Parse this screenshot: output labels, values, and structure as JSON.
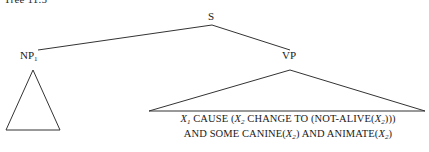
{
  "figure": {
    "type": "syntax-tree",
    "caption_fragment": "Tree 11.5",
    "background_color": "#ffffff",
    "line_color": "#333333",
    "text_color": "#1a1a1a"
  },
  "nodes": {
    "root": {
      "label": "S",
      "name": "s-node",
      "x": 212,
      "y": 18
    },
    "np": {
      "label": "NP",
      "subscript": "1",
      "name": "np-node",
      "x": 38,
      "y": 57
    },
    "vp": {
      "label": "VP",
      "name": "vp-node",
      "x": 290,
      "y": 57
    }
  },
  "triangles": [
    {
      "name": "np-triangle",
      "apex_x": 33,
      "apex_y": 70,
      "base_left_x": 6,
      "base_right_x": 60,
      "base_y": 130
    },
    {
      "name": "vp-triangle",
      "apex_x": 290,
      "apex_y": 70,
      "base_left_x": 149,
      "base_right_x": 425,
      "base_y": 111
    }
  ],
  "edges": [
    {
      "name": "s-to-np-edge",
      "x1": 212,
      "y1": 25,
      "x2": 38,
      "y2": 50
    },
    {
      "name": "s-to-vp-edge",
      "x1": 212,
      "y1": 25,
      "x2": 290,
      "y2": 50
    }
  ],
  "formula": {
    "line1_prefix": "",
    "line1_var1": "X",
    "line1_sub1": "1",
    "line1_mid1": " CAUSE (",
    "line1_var2": "X",
    "line1_sub2": "2",
    "line1_mid2": " CHANGE TO (NOT-ALIVE(",
    "line1_var3": "X",
    "line1_sub3": "2",
    "line1_suffix": ")))",
    "line2_prefix": "AND SOME CANINE(",
    "line2_var1": "X",
    "line2_sub1": "2",
    "line2_mid1": ") AND ANIMATE(",
    "line2_var2": "X",
    "line2_sub2": "2",
    "line2_suffix": ")",
    "line1_plain": "X1 CAUSE (X2 CHANGE TO (NOT-ALIVE(X2)))",
    "line2_plain": "AND SOME CANINE(X2) AND ANIMATE(X2)"
  }
}
